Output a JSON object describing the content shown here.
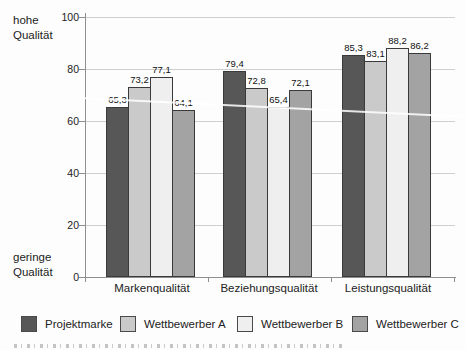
{
  "chart_data": {
    "type": "bar",
    "title": "",
    "categories": [
      "Markenqualität",
      "Beziehungsqualität",
      "Leistungsqualität"
    ],
    "series": [
      {
        "name": "Projektmarke",
        "color": "#575757",
        "values": [
          65.3,
          79.4,
          85.3
        ],
        "labels": [
          "65,3",
          "79,4",
          "85,3"
        ]
      },
      {
        "name": "Wettbewerber A",
        "color": "#cacaca",
        "values": [
          73.2,
          72.8,
          83.1
        ],
        "labels": [
          "73,2",
          "72,8",
          "83,1"
        ]
      },
      {
        "name": "Wettbewerber B",
        "color": "#efefef",
        "values": [
          77.1,
          65.4,
          88.2
        ],
        "labels": [
          "77,1",
          "65,4",
          "88,2"
        ]
      },
      {
        "name": "Wettbewerber C",
        "color": "#a3a3a3",
        "values": [
          64.1,
          72.1,
          86.2
        ],
        "labels": [
          "64,1",
          "72,1",
          "86,2"
        ]
      }
    ],
    "yaxis": {
      "ticks": [
        0,
        20,
        40,
        60,
        80,
        100
      ],
      "ylim": [
        0,
        100
      ],
      "top_label_line1": "hohe",
      "top_label_line2": "Qualität",
      "bottom_label_line1": "geringe",
      "bottom_label_line2": "Qualität"
    },
    "grid": true,
    "legend_position": "bottom"
  }
}
